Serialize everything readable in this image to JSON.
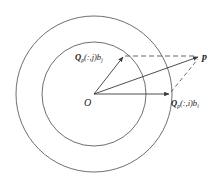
{
  "diagram": {
    "type": "vector-geometry",
    "colors": {
      "stroke": "#3a3a3a",
      "background": "#ffffff",
      "dash": "#555555"
    },
    "origin": {
      "label": "O",
      "x": 94,
      "y": 94
    },
    "circles": [
      {
        "name": "inner",
        "r": 52
      },
      {
        "name": "outer",
        "r": 78
      }
    ],
    "points": {
      "p": {
        "label": "p",
        "x": 199,
        "y": 57
      },
      "qj": {
        "label_main": "Q",
        "label_sub": "p",
        "label_rest": "(:,j)b",
        "label_sub2": "j",
        "x": 124,
        "y": 56
      },
      "qi": {
        "label_main": "Q",
        "label_sub": "p",
        "label_rest": "(:,i)b",
        "label_sub2": "i",
        "x": 170,
        "y": 94
      }
    }
  }
}
